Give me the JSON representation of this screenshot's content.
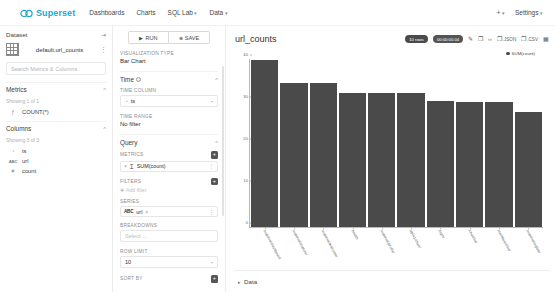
{
  "navbar": {
    "brand": "Superset",
    "brand_color": "#20a7c9",
    "links": [
      {
        "label": "Dashboards",
        "caret": false
      },
      {
        "label": "Charts",
        "caret": false
      },
      {
        "label": "SQL Lab",
        "caret": true
      },
      {
        "label": "Data",
        "caret": true
      }
    ],
    "plus_label": "+",
    "settings_label": "Settings"
  },
  "dataset_panel": {
    "header": "Dataset",
    "dataset_name": "default.url_counts",
    "search_placeholder": "Search Metrics & Columns",
    "metrics": {
      "title": "Metrics",
      "showing": "Showing 1 of 1",
      "items": [
        {
          "icon": "function-icon",
          "glyph": "ƒ",
          "label": "COUNT(*)"
        }
      ]
    },
    "columns": {
      "title": "Columns",
      "showing": "Showing 3 of 3",
      "items": [
        {
          "icon": "clock-icon",
          "glyph": "◔",
          "label": "ts"
        },
        {
          "icon": "abc-icon",
          "glyph": "ABC",
          "label": "url"
        },
        {
          "icon": "hash-icon",
          "glyph": "#",
          "label": "count"
        }
      ]
    }
  },
  "control_panel": {
    "run_label": "RUN",
    "save_label": "SAVE",
    "viz_type_label": "Visualization Type",
    "viz_type_value": "Bar Chart",
    "time_section": "Time",
    "time_column_label": "Time Column",
    "time_column_value": "ts",
    "time_range_label": "Time Range",
    "time_range_value": "No filter",
    "query_section": "Query",
    "metrics_label": "Metrics",
    "metric_value": "SUM(count)",
    "metric_prefix": "∑",
    "filters_label": "Filters",
    "add_filter_label": "Add filter",
    "series_label": "Series",
    "series_value": "url",
    "series_prefix": "ABC",
    "breakdowns_label": "Breakdowns",
    "breakdowns_placeholder": "Select ...",
    "row_limit_label": "Row limit",
    "row_limit_value": "10",
    "sort_by_label": "Sort by"
  },
  "chart_panel": {
    "title": "url_counts",
    "rows_badge": "10 rows",
    "time_badge": "00:00:00.04",
    "tools": [
      {
        "name": "edit-icon",
        "glyph": "✎",
        "label": ""
      },
      {
        "name": "camera-icon",
        "glyph": "❐",
        "label": ""
      },
      {
        "name": "code-icon",
        "glyph": "‹›",
        "label": ""
      },
      {
        "name": "json-download-icon",
        "glyph": "❐",
        "label": ".JSON"
      },
      {
        "name": "csv-download-icon",
        "glyph": "❐",
        "label": ".CSV"
      },
      {
        "name": "more-options-icon",
        "glyph": "▦",
        "label": ""
      }
    ],
    "data_drawer_label": "Data"
  },
  "chart_data": {
    "type": "bar",
    "title": "url_counts",
    "xlabel": "",
    "ylabel": "",
    "ylim": [
      0,
      40
    ],
    "yticks": [
      0,
      10,
      20,
      30,
      40
    ],
    "grid": false,
    "legend_position": "top-right",
    "legend": [
      "SUM(count)"
    ],
    "series_color": "#4a4a4a",
    "categories": [
      "/superset/dashboard/",
      "/superset/explore/",
      "/superset/welcome/",
      "/health",
      "/superset/profile/",
      "/api/v1/chart/",
      "/login/",
      "/chart/list/",
      "/dashboard/list/",
      "/superset/sqllab/"
    ],
    "values": [
      39.8,
      34.2,
      34.3,
      32.0,
      31.9,
      31.9,
      30.0,
      29.8,
      29.8,
      27.4
    ]
  }
}
